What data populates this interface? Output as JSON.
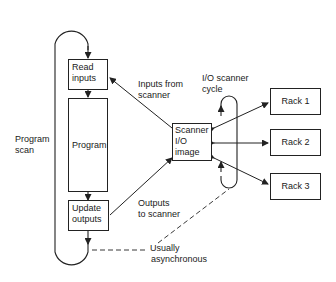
{
  "diagram": {
    "boxes": {
      "read_inputs": [
        "Read",
        "inputs"
      ],
      "program": "Program",
      "update_outputs": [
        "Update",
        "outputs"
      ],
      "scanner": [
        "Scanner",
        "I/O",
        "image"
      ],
      "racks": [
        "Rack 1",
        "Rack 2",
        "Rack 3"
      ]
    },
    "labels": {
      "program_scan": [
        "Program",
        "scan"
      ],
      "inputs_from_scanner": [
        "Inputs from",
        "scanner"
      ],
      "outputs_to_scanner": [
        "Outputs",
        "to scanner"
      ],
      "io_scanner_cycle": [
        "I/O scanner",
        "cycle"
      ],
      "usually_async": [
        "Usually",
        "asynchronous"
      ]
    },
    "colors": {
      "line": "#222222",
      "background": "#ffffff"
    }
  }
}
